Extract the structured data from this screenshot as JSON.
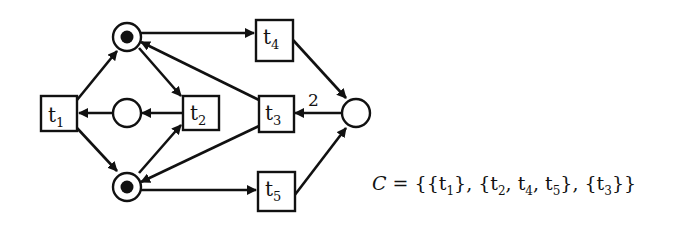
{
  "diagram": {
    "type": "petri-net",
    "places": [
      {
        "id": "p_top",
        "tokens": 1
      },
      {
        "id": "p_mid",
        "tokens": 0
      },
      {
        "id": "p_bottom",
        "tokens": 1
      },
      {
        "id": "p_right",
        "tokens": 0
      }
    ],
    "transitions": [
      {
        "id": "t1",
        "base": "t",
        "sub": "1"
      },
      {
        "id": "t2",
        "base": "t",
        "sub": "2"
      },
      {
        "id": "t3",
        "base": "t",
        "sub": "3"
      },
      {
        "id": "t4",
        "base": "t",
        "sub": "4"
      },
      {
        "id": "t5",
        "base": "t",
        "sub": "5"
      }
    ],
    "arcs": [
      {
        "from": "t1",
        "to": "p_top"
      },
      {
        "from": "t1",
        "to": "p_bottom"
      },
      {
        "from": "p_mid",
        "to": "t1"
      },
      {
        "from": "p_top",
        "to": "t2"
      },
      {
        "from": "p_bottom",
        "to": "t2"
      },
      {
        "from": "t2",
        "to": "p_mid"
      },
      {
        "from": "p_top",
        "to": "t4"
      },
      {
        "from": "p_bottom",
        "to": "t5"
      },
      {
        "from": "t4",
        "to": "p_right"
      },
      {
        "from": "t5",
        "to": "p_right"
      },
      {
        "from": "p_right",
        "to": "t3",
        "weight": "2"
      },
      {
        "from": "t3",
        "to": "p_top"
      },
      {
        "from": "t3",
        "to": "p_bottom"
      }
    ],
    "arc_weight_label": "2"
  },
  "formula": {
    "symbol": "C",
    "equals": "=",
    "open": "{",
    "sets": [
      {
        "items": [
          {
            "base": "t",
            "sub": "1"
          }
        ]
      },
      {
        "items": [
          {
            "base": "t",
            "sub": "2"
          },
          {
            "base": "t",
            "sub": "4"
          },
          {
            "base": "t",
            "sub": "5"
          }
        ]
      },
      {
        "items": [
          {
            "base": "t",
            "sub": "3"
          }
        ]
      }
    ],
    "close": "}",
    "text": "C = {{t1}, {t2, t4, t5}, {t3}}"
  }
}
